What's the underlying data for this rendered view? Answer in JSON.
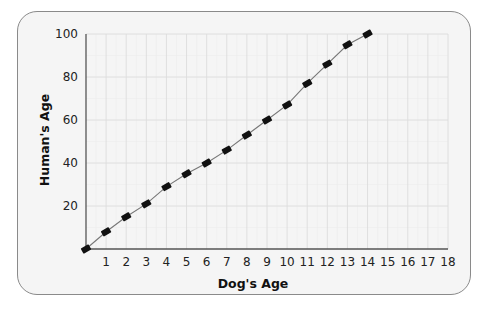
{
  "chart_data": {
    "type": "line",
    "title": "",
    "xlabel": "Dog's Age",
    "ylabel": "Human's Age",
    "x": [
      0,
      1,
      2,
      3,
      4,
      5,
      6,
      7,
      8,
      9,
      10,
      11,
      12,
      13,
      14
    ],
    "series": [
      {
        "name": "Human's Age",
        "values": [
          0,
          8,
          15,
          21,
          29,
          35,
          40,
          46,
          53,
          60,
          67,
          77,
          86,
          95,
          100
        ]
      }
    ],
    "xlim": [
      0,
      18
    ],
    "ylim": [
      0,
      100
    ],
    "x_ticks": [
      1,
      2,
      3,
      4,
      5,
      6,
      7,
      8,
      9,
      10,
      11,
      12,
      13,
      14,
      15,
      16,
      17,
      18
    ],
    "y_ticks": [
      20,
      40,
      60,
      80,
      100
    ],
    "grid": true,
    "legend": "none",
    "marker": "filled-diamond-rectangle",
    "colors": {
      "line": "#777777",
      "marker": "#111111",
      "grid": "#dcdcdc",
      "axis": "#555555",
      "frame_bg": "#f5f5f5",
      "frame_border": "#8a8a8a"
    }
  },
  "axes": {
    "x_title": "Dog's Age",
    "y_title": "Human's Age"
  }
}
